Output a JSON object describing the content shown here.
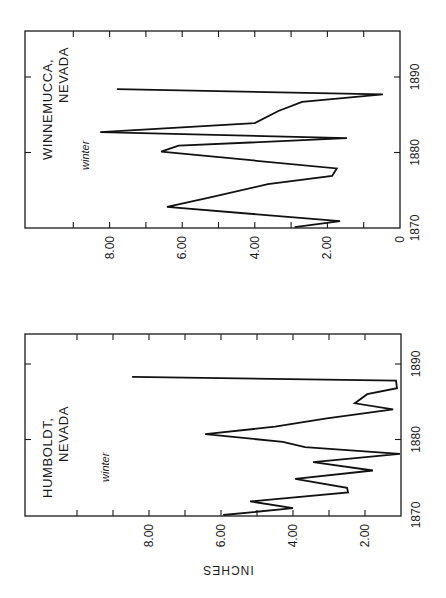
{
  "figure": {
    "orientation": "rotated 90 degrees counter-clockwise",
    "axis_label": "INCHES"
  },
  "charts": [
    {
      "id": "winnemucca",
      "title_line1": "WINNEMUCCA,",
      "title_line2": "NEVADA",
      "season": "winter"
    },
    {
      "id": "humboldt",
      "title_line1": "HUMBOLDT,",
      "title_line2": "NEVADA",
      "season": "winter"
    }
  ],
  "chart_data": [
    {
      "type": "line",
      "title": "WINNEMUCCA, NEVADA — winter",
      "xlabel": "Year",
      "ylabel": "INCHES",
      "xlim": [
        1870,
        1895
      ],
      "ylim": [
        0,
        9.5
      ],
      "x_ticks": [
        1870,
        1880,
        1890
      ],
      "y_tick_labels": [
        "0",
        "2.00",
        "4.00",
        "6.00",
        "8.00"
      ],
      "y_ticks": [
        0,
        1,
        2,
        3,
        4,
        5,
        6,
        7,
        8,
        9
      ],
      "grid": false,
      "series": [
        {
          "name": "Winnemucca winter precipitation",
          "x": [
            1870.1,
            1870.9,
            1872.8,
            1874.0,
            1875.8,
            1876.9,
            1877.9,
            1880.1,
            1880.9,
            1881.9,
            1882.7,
            1883.9,
            1885.5,
            1886.7,
            1887.7,
            1888.4
          ],
          "y": [
            2.9,
            1.65,
            6.42,
            5.29,
            3.64,
            1.87,
            1.74,
            6.58,
            6.1,
            1.46,
            8.26,
            4.0,
            3.35,
            2.7,
            0.47,
            7.8
          ]
        }
      ]
    },
    {
      "type": "line",
      "title": "HUMBOLDT, NEVADA — winter",
      "xlabel": "Year",
      "ylabel": "INCHES",
      "xlim": [
        1870,
        1894
      ],
      "ylim": [
        1.0,
        10.5
      ],
      "x_ticks": [
        1870,
        1880,
        1890
      ],
      "y_tick_labels": [
        "2.00",
        "4.00",
        "6.00",
        "8.00"
      ],
      "y_ticks": [
        2,
        3,
        4,
        5,
        6,
        7,
        8,
        9,
        10
      ],
      "grid": false,
      "series": [
        {
          "name": "Humboldt winter precipitation",
          "x": [
            1870.0,
            1870.9,
            1871.8,
            1873.0,
            1873.6,
            1874.8,
            1875.9,
            1877.0,
            1878.1,
            1879.0,
            1879.7,
            1880.7,
            1881.7,
            1882.8,
            1884.0,
            1884.8,
            1886.0,
            1886.8,
            1887.8,
            1888.3
          ],
          "y": [
            5.94,
            4.0,
            5.19,
            2.47,
            2.5,
            3.94,
            1.78,
            3.44,
            1.03,
            3.67,
            4.28,
            6.44,
            4.5,
            3.06,
            1.22,
            2.28,
            1.94,
            1.11,
            1.14,
            8.47
          ]
        }
      ]
    }
  ],
  "layout": {
    "winnemucca": {
      "left": 25,
      "right": 400,
      "top": 31,
      "bottom": 228,
      "zero_x": 400,
      "px_per_inch": 36.3,
      "year0_y": 228,
      "px_per_year": 7.55
    },
    "humboldt": {
      "left": 25,
      "right": 401,
      "top": 334,
      "bottom": 516,
      "zero_x": 437,
      "px_per_inch": 36.0,
      "year0_y": 515,
      "px_per_year": 7.55
    }
  }
}
